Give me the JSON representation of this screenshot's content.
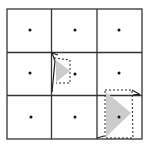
{
  "diagram": {
    "grid": {
      "rows": 3,
      "cols": 3,
      "line_color": "#333333",
      "x0": 7,
      "y0": 9,
      "x1": 142,
      "y1": 139
    },
    "dots": [
      {
        "cx": 30,
        "cy": 30
      },
      {
        "cx": 75,
        "cy": 30
      },
      {
        "cx": 119,
        "cy": 30
      },
      {
        "cx": 30,
        "cy": 73
      },
      {
        "cx": 75,
        "cy": 74
      },
      {
        "cx": 119,
        "cy": 73
      },
      {
        "cx": 31,
        "cy": 117
      },
      {
        "cx": 75,
        "cy": 117
      },
      {
        "cx": 119,
        "cy": 117
      }
    ],
    "shapes": [
      {
        "name": "small-triangle",
        "fill": "#cccccc",
        "box": {
          "x": 55,
          "y": 57,
          "w": 15,
          "h": 26
        }
      },
      {
        "name": "large-triangle",
        "fill": "#cccccc",
        "box": {
          "x": 105,
          "y": 90,
          "w": 28,
          "h": 48
        }
      }
    ]
  }
}
